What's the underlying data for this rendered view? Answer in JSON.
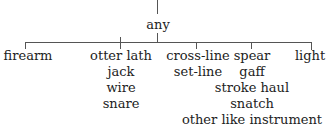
{
  "tree": {
    "root": {
      "label": "any"
    },
    "branches": [
      {
        "items": [
          "firearm"
        ]
      },
      {
        "items": [
          "otter lath",
          "jack",
          "wire",
          "snare"
        ]
      },
      {
        "items": [
          "cross-line",
          "set-line"
        ]
      },
      {
        "items": [
          "spear",
          "gaff",
          "stroke haul",
          "snatch",
          "other like instrument"
        ]
      },
      {
        "items": [
          "light"
        ]
      }
    ]
  }
}
